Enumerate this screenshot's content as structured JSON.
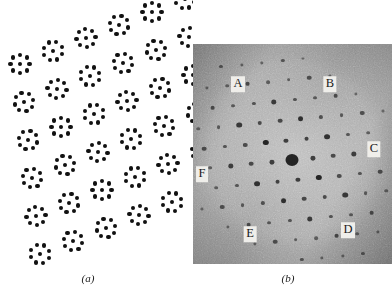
{
  "figure": {
    "kind": "two-panel scientific figure",
    "panels": [
      {
        "id": "a",
        "caption": "(a)",
        "type": "schematic-dot-lattice",
        "description": "Oblique lattice of molecular clusters, each cluster an 8-dot ring with a central dot"
      },
      {
        "id": "b",
        "caption": "(b)",
        "type": "electron-diffraction-micrograph",
        "description": "Grainy greyscale electron diffraction pattern with hexagonal array of spots"
      }
    ]
  },
  "panel_a": {
    "caption": "(a)",
    "background_color": "#ffffff",
    "dot_color": "#111111",
    "dots_per_ring": 8,
    "center_dot": true,
    "cluster_count": 24,
    "cluster_ring_radius": 9.5,
    "dot_diameter": 4.2,
    "lattice": {
      "type": "oblique",
      "a_vector": [
        33,
        -13
      ],
      "b_vector": [
        4,
        38
      ],
      "origin": [
        20,
        64
      ],
      "cols": 6,
      "rows": 6
    }
  },
  "panel_b": {
    "caption": "(b)",
    "frame": {
      "x": 193,
      "y": 44,
      "width": 199,
      "height": 220
    },
    "base_gray": "#9a9a9a",
    "spot_color": "#1b1b1b",
    "labels": [
      {
        "id": "A",
        "text": "A",
        "x": 45,
        "y": 40
      },
      {
        "id": "B",
        "text": "B",
        "x": 137,
        "y": 40
      },
      {
        "id": "C",
        "text": "C",
        "x": 181,
        "y": 105
      },
      {
        "id": "D",
        "text": "D",
        "x": 155,
        "y": 186
      },
      {
        "id": "E",
        "text": "E",
        "x": 57,
        "y": 190
      },
      {
        "id": "F",
        "text": "F",
        "x": 9,
        "y": 130
      }
    ],
    "label_background": "#efeeea",
    "label_text_color": "#1a1a1a",
    "central_spot": {
      "x": 99,
      "y": 116,
      "radius": 6.5
    },
    "spot_lattice": {
      "type": "hexagonal",
      "a_vector": [
        20.5,
        -2.0
      ],
      "b_vector": [
        6.0,
        19.5
      ],
      "origin": [
        99,
        116
      ],
      "range": 5
    }
  }
}
